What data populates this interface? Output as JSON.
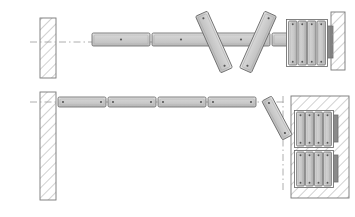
{
  "diagram": {
    "type": "technical-plan-drawing",
    "width": 355,
    "height": 217,
    "background_color": "#ffffff"
  },
  "colors": {
    "outline": "#6b6b6b",
    "panel_fill": "#c8c8c8",
    "panel_fill_light": "#d6d6d6",
    "panel_highlight": "#e2e2e2",
    "bracket_dark": "#8a8a8a",
    "hatch_line": "#9a9a9a",
    "wall_outline": "#777777",
    "centerline": "#9a9a9a",
    "dot": "#555555"
  },
  "views": [
    {
      "name": "upper-view",
      "label": "Upper plan view — panels extended with folding pair",
      "wall_left": {
        "name": "left-wall",
        "x": 40,
        "y": 18,
        "width": 16,
        "height": 60,
        "hatch": "diagonal-45"
      },
      "centerline": {
        "y": 42,
        "x_start": 30,
        "x_end": 330,
        "style": "dash-dot"
      },
      "panels": [
        {
          "id": "u1",
          "x": 92,
          "y": 33,
          "width": 58,
          "height": 13,
          "angle": 0,
          "dots": 1
        },
        {
          "id": "u2",
          "x": 152,
          "y": 33,
          "width": 58,
          "height": 13,
          "angle": 0,
          "dots": 1
        },
        {
          "id": "u3",
          "x": 212,
          "y": 33,
          "width": 58,
          "height": 13,
          "angle": 0,
          "dots": 1
        },
        {
          "id": "u4",
          "x": 272,
          "y": 33,
          "width": 58,
          "height": 13,
          "angle": 0,
          "dots": 1
        }
      ],
      "tilted_panels": [
        {
          "id": "u5",
          "cx": 214,
          "cy": 42,
          "length": 62,
          "thickness": 13,
          "angle": 66
        },
        {
          "id": "u6",
          "cx": 258,
          "cy": 42,
          "length": 62,
          "thickness": 13,
          "angle": -66
        }
      ],
      "stack": {
        "name": "panel-stack-upper",
        "x": 288,
        "y": 21,
        "width": 38,
        "height": 44,
        "panel_count": 4,
        "bracket": {
          "x": 326,
          "y": 26,
          "width": 7,
          "height": 32
        }
      },
      "wall_right": {
        "name": "right-wall",
        "x": 331,
        "y": 12,
        "width": 14,
        "height": 58,
        "hatch": "diagonal-45"
      }
    },
    {
      "name": "lower-view",
      "label": "Lower plan view — panels retracted into wall pocket",
      "wall_left": {
        "name": "left-wall-tall",
        "x": 40,
        "y": 92,
        "width": 16,
        "height": 108,
        "hatch": "diagonal-45"
      },
      "centerline": {
        "y": 102,
        "x_start": 30,
        "x_end": 285,
        "style": "dash-dot"
      },
      "panels": [
        {
          "id": "l1",
          "x": 58,
          "y": 97,
          "width": 48,
          "height": 10,
          "angle": 0,
          "dots": 2
        },
        {
          "id": "l2",
          "x": 108,
          "y": 97,
          "width": 48,
          "height": 10,
          "angle": 0,
          "dots": 2
        },
        {
          "id": "l3",
          "x": 158,
          "y": 97,
          "width": 48,
          "height": 10,
          "angle": 0,
          "dots": 2
        },
        {
          "id": "l4",
          "x": 208,
          "y": 97,
          "width": 48,
          "height": 10,
          "angle": 0,
          "dots": 2
        }
      ],
      "tilted_panels": [
        {
          "id": "l5",
          "cx": 277,
          "cy": 118,
          "length": 44,
          "thickness": 11,
          "angle": 62
        }
      ],
      "leader": {
        "x": 283,
        "y_start": 96,
        "y_end": 190,
        "style": "dash-dot"
      },
      "pocket": {
        "name": "wall-pocket",
        "x": 291,
        "y": 96,
        "width": 58,
        "height": 102,
        "hatch": "diagonal-45"
      },
      "stacks": [
        {
          "name": "panel-stack-lower-upper",
          "x": 296,
          "y": 112,
          "width": 36,
          "height": 34,
          "panel_count": 4,
          "bracket": {
            "x": 332,
            "y": 115,
            "width": 6,
            "height": 27
          }
        },
        {
          "name": "panel-stack-lower-lower",
          "x": 296,
          "y": 152,
          "width": 36,
          "height": 34,
          "panel_count": 4,
          "bracket": {
            "x": 332,
            "y": 155,
            "width": 6,
            "height": 27
          }
        }
      ]
    }
  ]
}
